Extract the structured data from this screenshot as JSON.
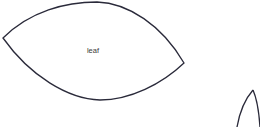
{
  "canvas": {
    "width": 260,
    "height": 127,
    "background_color": "#ffffff"
  },
  "style": {
    "stroke_color": "#2a2a3a",
    "stroke_width": 1.3,
    "label_color": "#3a3a3a",
    "label_font_size": 7.5
  },
  "shapes": [
    {
      "name": "leaf",
      "label": "leaf",
      "label_x": 93,
      "label_y": 51,
      "left_vertex": [
        3,
        38
      ],
      "right_vertex": [
        184,
        63
      ],
      "top_apex": [
        97,
        2
      ],
      "bottom_apex": [
        100,
        100
      ],
      "path": "M 3 38 C 30 11, 66 2, 97 2 C 128 3, 162 25, 184 63 C 162 84, 130 100, 100 100 C 68 99, 30 76, 3 38 Z",
      "clipped": false
    },
    {
      "name": "leaf-partial",
      "label": "",
      "apex": [
        253,
        90
      ],
      "path_top_arc": "M 253 90 C 246 98, 240 110, 237 127",
      "path_bottom_arc": "M 253 90 C 257 99, 259 112, 260 127",
      "clipped": true
    }
  ]
}
